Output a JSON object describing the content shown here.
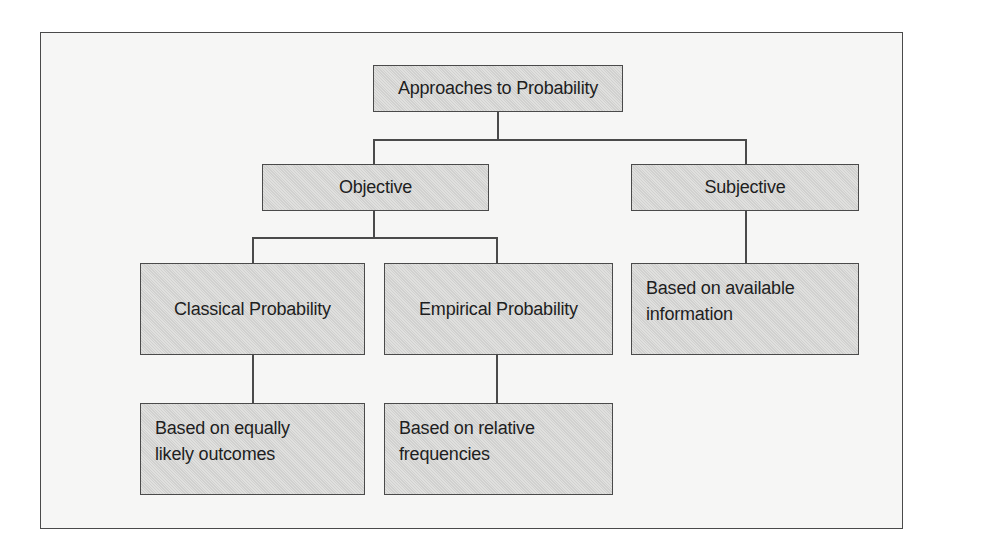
{
  "diagram": {
    "type": "hierarchy",
    "root": {
      "label": "Approaches to Probability"
    },
    "level1": [
      {
        "id": "objective",
        "label": "Objective"
      },
      {
        "id": "subjective",
        "label": "Subjective"
      }
    ],
    "level2": [
      {
        "id": "classical",
        "parent": "objective",
        "label": "Classical Probability"
      },
      {
        "id": "empirical",
        "parent": "objective",
        "label": "Empirical Probability"
      },
      {
        "id": "subjective_desc",
        "parent": "subjective",
        "label": "Based on available information",
        "lines": [
          "Based on available",
          "information"
        ]
      }
    ],
    "level3": [
      {
        "id": "classical_desc",
        "parent": "classical",
        "label": "Based on equally likely outcomes",
        "lines": [
          "Based on equally",
          "likely outcomes"
        ]
      },
      {
        "id": "empirical_desc",
        "parent": "empirical",
        "label": "Based on relative frequencies",
        "lines": [
          "Based on relative",
          "frequencies"
        ]
      }
    ],
    "colors": {
      "node_fill": "#d9d9d7",
      "node_border": "#4a4a4a",
      "frame_fill": "#f6f6f5",
      "text": "#1e1e1e"
    }
  }
}
